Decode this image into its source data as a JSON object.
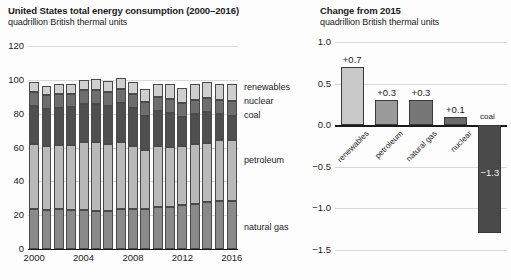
{
  "left": {
    "title": "United States total energy consumption (2000–2016)",
    "subtitle": "quadrillion British thermal units",
    "series_labels": {
      "renewables": "renewables",
      "nuclear": "nuclear",
      "coal": "coal",
      "petroleum": "petroleum",
      "natural_gas": "natural gas"
    }
  },
  "right": {
    "title": "Change from 2015",
    "subtitle": "quadrillion British thermal units"
  },
  "caption": "",
  "colors": {
    "natural_gas": "#8a8a8a",
    "petroleum": "#b9b9b9",
    "coal": "#4f4f4f",
    "nuclear": "#6e6e6e",
    "renewables": "#cfcfcf",
    "change_renewables": "#c9c9c9",
    "change_petroleum": "#9a9a9a",
    "change_natural_gas": "#777777",
    "change_nuclear": "#6a6a6a",
    "change_coal": "#4a4a4a",
    "gridline": "#d8d8d8",
    "axis": "#1b1b1b",
    "background": "#fdfdfd"
  },
  "chart_data": [
    {
      "type": "bar",
      "id": "total-energy-consumption",
      "stacked": true,
      "title": "United States total energy consumption (2000–2016)",
      "subtitle": "quadrillion British thermal units",
      "xlabel": "",
      "ylabel": "quadrillion British thermal units",
      "ylim": [
        0,
        120
      ],
      "yticks": [
        0,
        20,
        40,
        60,
        80,
        100,
        120
      ],
      "ytick_labels": [
        "0",
        "20",
        "40",
        "60",
        "80",
        "100",
        "120"
      ],
      "grid": true,
      "legend": "right-of-plot inline labels",
      "categories": [
        "2000",
        "2001",
        "2002",
        "2003",
        "2004",
        "2005",
        "2006",
        "2007",
        "2008",
        "2009",
        "2010",
        "2011",
        "2012",
        "2013",
        "2014",
        "2015",
        "2016"
      ],
      "xtick_labels": [
        "2000",
        "2004",
        "2008",
        "2012",
        "2016"
      ],
      "series": [
        {
          "name": "natural gas",
          "values": [
            23.8,
            22.8,
            23.5,
            22.8,
            22.9,
            22.6,
            22.2,
            23.6,
            23.8,
            23.4,
            24.6,
            25.0,
            26.1,
            26.8,
            27.5,
            28.2,
            28.4
          ]
        },
        {
          "name": "petroleum",
          "values": [
            38.3,
            38.2,
            38.2,
            38.8,
            40.3,
            40.4,
            40.0,
            39.8,
            37.3,
            35.4,
            36.0,
            35.4,
            34.7,
            35.1,
            35.3,
            36.0,
            36.3
          ]
        },
        {
          "name": "coal",
          "values": [
            22.6,
            21.9,
            21.9,
            22.3,
            22.5,
            22.8,
            22.4,
            22.7,
            22.4,
            19.7,
            20.8,
            19.7,
            17.4,
            18.0,
            18.0,
            15.5,
            14.2
          ]
        },
        {
          "name": "nuclear",
          "values": [
            7.9,
            8.0,
            8.1,
            7.9,
            8.2,
            8.2,
            8.2,
            8.5,
            8.4,
            8.4,
            8.4,
            8.3,
            8.1,
            8.2,
            8.3,
            8.3,
            8.4
          ]
        },
        {
          "name": "renewables",
          "values": [
            6.1,
            5.3,
            5.8,
            6.0,
            6.1,
            6.2,
            6.6,
            6.6,
            7.1,
            7.5,
            8.0,
            9.1,
            8.6,
            9.3,
            9.6,
            9.5,
            10.2
          ]
        }
      ],
      "totals": [
        98.7,
        96.2,
        97.5,
        97.8,
        100.0,
        100.2,
        99.4,
        101.2,
        99.0,
        94.4,
        97.8,
        97.5,
        94.9,
        97.4,
        98.7,
        97.5,
        97.5
      ]
    },
    {
      "type": "bar",
      "id": "change-from-2015",
      "stacked": false,
      "title": "Change from 2015",
      "subtitle": "quadrillion British thermal units",
      "xlabel": "",
      "ylabel": "quadrillion British thermal units",
      "ylim": [
        -1.5,
        1.0
      ],
      "yticks": [
        1.0,
        0.5,
        0.0,
        -0.5,
        -1.0,
        -1.5
      ],
      "ytick_labels": [
        "1.0",
        "0.5",
        "0.0",
        "−0.5",
        "−1.0",
        "−1.5"
      ],
      "grid": true,
      "categories": [
        "renewables",
        "petroleum",
        "natural gas",
        "nuclear",
        "coal"
      ],
      "values": [
        0.7,
        0.3,
        0.3,
        0.1,
        -1.3
      ],
      "data_labels": [
        "+0.7",
        "+0.3",
        "+0.3",
        "+0.1",
        "−1.3"
      ]
    }
  ]
}
